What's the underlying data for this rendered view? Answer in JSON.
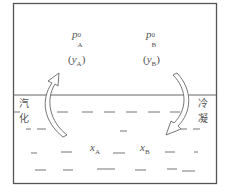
{
  "vapor": {
    "label_A": {
      "symbol": "p",
      "sub": "A",
      "sup": "0"
    },
    "label_B": {
      "symbol": "p",
      "sub": "B",
      "sup": "0"
    },
    "mole_A": {
      "symbol": "y",
      "sub": "A"
    },
    "mole_B": {
      "symbol": "y",
      "sub": "B"
    }
  },
  "liquid": {
    "mole_A": {
      "symbol": "x",
      "sub": "A"
    },
    "mole_B": {
      "symbol": "x",
      "sub": "B"
    }
  },
  "processes": {
    "vaporization": [
      "汽",
      "化"
    ],
    "condensation": [
      "冷",
      "凝"
    ]
  },
  "colors": {
    "line": "#555555",
    "text": "#555555"
  }
}
